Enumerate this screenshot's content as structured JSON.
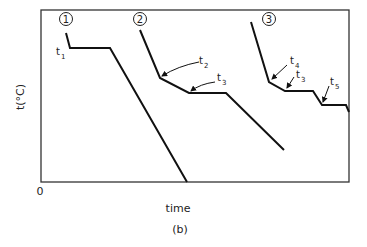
{
  "figure": {
    "caption": "(b)",
    "xlabel": "time",
    "ylabel": "t(°C)",
    "origin_label": "0",
    "curves": [
      {
        "id": "1",
        "label": "①",
        "marker": "1"
      },
      {
        "id": "2",
        "label": "②",
        "marker": "2"
      },
      {
        "id": "3",
        "label": "③",
        "marker": "3"
      }
    ],
    "annotations": [
      {
        "text": "t",
        "sub": "1"
      },
      {
        "text": "t",
        "sub": "2"
      },
      {
        "text": "t",
        "sub": "3"
      },
      {
        "text": "t",
        "sub": "4"
      },
      {
        "text": "t",
        "sub": "3"
      },
      {
        "text": "t",
        "sub": "5"
      }
    ]
  },
  "colors": {
    "line": "#111111",
    "frame": "#333333"
  }
}
